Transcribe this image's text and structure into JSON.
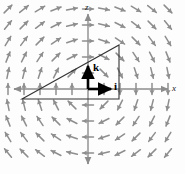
{
  "figure": {
    "name": "vector-field-xz-plane-with-triangular-contour",
    "width": 185,
    "height": 174,
    "background": "#fdfdfd"
  },
  "axes": {
    "origin": {
      "x": 88,
      "y": 89
    },
    "x_axis": {
      "label": "x",
      "label_x": 172,
      "label_y": 84,
      "start_x": 14,
      "end_x": 168,
      "y": 89
    },
    "z_axis": {
      "label": "z",
      "label_x": 85,
      "label_y": 3,
      "start_y": 14,
      "end_y": 164,
      "x": 88
    },
    "color": "#8c8c8c",
    "width": 1.4
  },
  "unit_vectors": [
    {
      "name": "k",
      "label": "k",
      "from_x": 88,
      "from_y": 89,
      "to_x": 88,
      "to_y": 66,
      "label_x": 93,
      "label_y": 62,
      "color": "#000000"
    },
    {
      "name": "i",
      "label": "i",
      "from_x": 88,
      "from_y": 89,
      "to_x": 111,
      "to_y": 89,
      "label_x": 114,
      "label_y": 81,
      "color": "#000000"
    }
  ],
  "contour": {
    "name": "triangular-contour",
    "color": "#333333",
    "width": 1.1,
    "points": [
      {
        "x": 22,
        "y": 99
      },
      {
        "x": 119,
        "y": 45
      },
      {
        "x": 119,
        "y": 99
      }
    ],
    "closed": true
  },
  "vector_field": {
    "type": "clockwise-vortex",
    "description": "arrows circulate clockwise about the origin in the xz-plane",
    "arrow_color": "#8e8e8e",
    "arrow_length": 11,
    "grid_spacing": 16,
    "grid_origin_x": 88,
    "grid_origin_y": 89,
    "cols_left": 5,
    "cols_right": 5,
    "rows_up": 5,
    "rows_down": 5
  },
  "chart_data": {
    "type": "scatter",
    "title": "",
    "xlabel": "x",
    "ylabel": "z",
    "grid": false,
    "legend": null,
    "annotations": [
      "k",
      "i"
    ]
  }
}
